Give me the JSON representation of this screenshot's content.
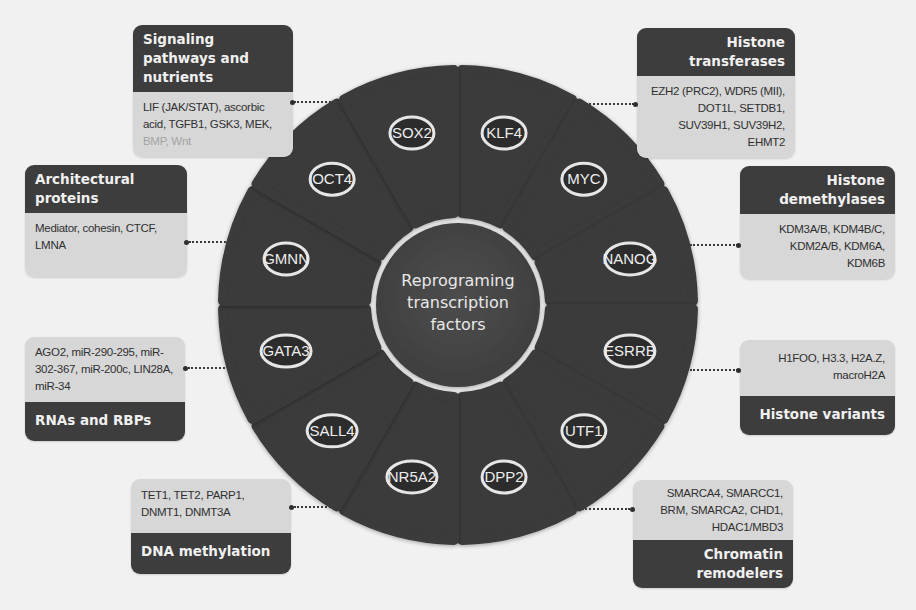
{
  "center": {
    "label_lines": [
      "Reprograming",
      "transcription",
      "factors"
    ]
  },
  "segments": [
    {
      "label": "KLF4"
    },
    {
      "label": "MYC"
    },
    {
      "label": "NANOG"
    },
    {
      "label": "ESRRB"
    },
    {
      "label": "UTF1"
    },
    {
      "label": "DPP2"
    },
    {
      "label": "NR5A2"
    },
    {
      "label": "SALL4"
    },
    {
      "label": "GATA3"
    },
    {
      "label": "GMNN"
    },
    {
      "label": "OCT4"
    },
    {
      "label": "SOX2"
    }
  ],
  "boxes": {
    "signaling": {
      "title": "Signaling pathways and nutrients",
      "items": "LIF (JAK/STAT), ascorbic acid, TGFB1, GSK3, MEK,",
      "items_faded": "BMP, Wnt"
    },
    "histone_transferases": {
      "title": "Histone transferases",
      "items": "EZH2 (PRC2), WDR5 (MII), DOT1L, SETDB1, SUV39H1, SUV39H2, EHMT2"
    },
    "architectural": {
      "title": "Architectural proteins",
      "items": "Mediator, cohesin, CTCF, LMNA"
    },
    "histone_demethylases": {
      "title": "Histone demethylases",
      "items": "KDM3A/B, KDM4B/C, KDM2A/B, KDM6A, KDM6B"
    },
    "rnas": {
      "title": "RNAs and RBPs",
      "items": "AGO2, miR-290-295, miR-302-367, miR-200c, LIN28A, miR-34"
    },
    "histone_variants": {
      "title": "Histone variants",
      "items": "H1FOO, H3.3, H2A.Z, macroH2A"
    },
    "dna_methylation": {
      "title": "DNA methylation",
      "items": "TET1, TET2, PARP1, DNMT1, DNMT3A"
    },
    "chromatin": {
      "title": "Chromatin remodelers",
      "items": "SMARCA4, SMARCC1, BRM, SMARCA2, CHD1, HDAC1/MBD3"
    }
  },
  "colors": {
    "segment": "#3a3a3a",
    "center": "#474747",
    "header": "#3d3d3d",
    "body": "#d7d7d7",
    "background": "#f1f1f1"
  }
}
